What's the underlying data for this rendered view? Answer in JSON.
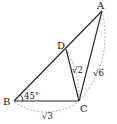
{
  "figure": {
    "points": {
      "A": {
        "label": "A",
        "x": 102,
        "y": 11
      },
      "B": {
        "label": "B",
        "x": 14,
        "y": 101
      },
      "C": {
        "label": "C",
        "x": 79,
        "y": 101
      },
      "D": {
        "label": "D",
        "x": 66,
        "y": 49
      }
    },
    "segments": [
      "AB",
      "BC",
      "CA",
      "DC"
    ],
    "angle_label": "45°",
    "lengths": {
      "BC": "√3",
      "DC": "√2",
      "AC": "√6"
    },
    "colors": {
      "line": "#222222",
      "dashed": "#999999",
      "text": "#222222"
    }
  }
}
